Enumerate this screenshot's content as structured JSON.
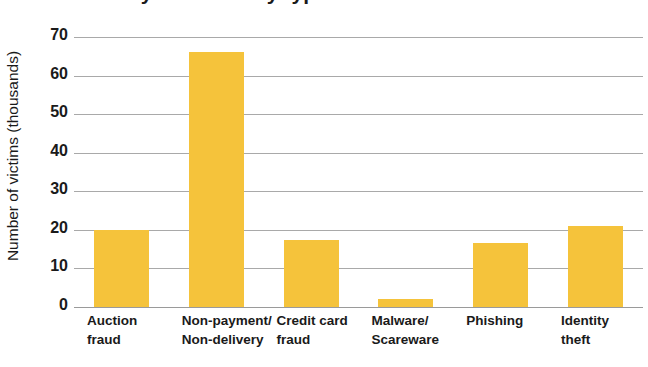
{
  "chart_data": {
    "type": "bar",
    "title": "Victims of cyber crime by type of crime",
    "xlabel": "",
    "ylabel": "Number of victims (thousands)",
    "categories": [
      "Auction fraud",
      "Non-payment/ Non-delivery",
      "Credit card fraud",
      "Malware/ Scareware",
      "Phishing",
      "Identity theft"
    ],
    "category_lines": [
      [
        "Auction",
        "fraud"
      ],
      [
        "Non-payment/",
        "Non-delivery"
      ],
      [
        "Credit card",
        "fraud"
      ],
      [
        "Malware/",
        "Scareware"
      ],
      [
        "Phishing",
        ""
      ],
      [
        "Identity",
        "theft"
      ]
    ],
    "values": [
      20,
      66,
      17.5,
      2,
      16.5,
      21
    ],
    "ylim": [
      0,
      70
    ],
    "yticks": [
      70,
      60,
      50,
      40,
      30,
      20,
      10,
      0
    ],
    "ytick_labels": [
      "70",
      "60",
      "50",
      "40",
      "30",
      "20",
      "10",
      "0"
    ],
    "grid": true,
    "legend": false,
    "bar_color": "#f5c33b",
    "gridline_color": "#a9a9a9",
    "background": "#ffffff"
  }
}
